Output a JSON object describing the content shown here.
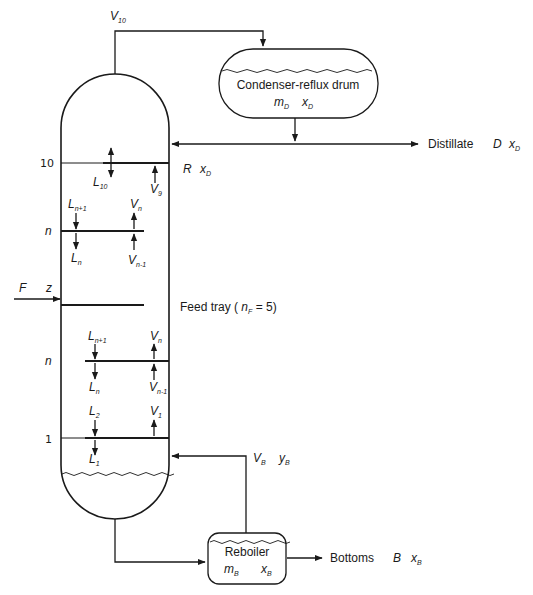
{
  "diagram": {
    "colors": {
      "line": "#1a1a1a",
      "background": "#ffffff"
    },
    "top_vapor": {
      "symbol": "V",
      "subscript": "10"
    },
    "condenser": {
      "label": "Condenser-reflux drum",
      "holdup": {
        "symbol": "m",
        "subscript": "D"
      },
      "composition": {
        "symbol": "x",
        "subscript": "D"
      }
    },
    "distillate": {
      "label": "Distillate",
      "flow": "D",
      "composition": {
        "symbol": "x",
        "subscript": "D"
      }
    },
    "reflux": {
      "flow": "R",
      "composition": {
        "symbol": "x",
        "subscript": "D"
      }
    },
    "trays": {
      "top": {
        "number": "10",
        "liquid": {
          "symbol": "L",
          "subscript": "10"
        },
        "vapor": {
          "symbol": "V",
          "subscript": "9"
        }
      },
      "rectifying_n": {
        "number": "n",
        "liquid_in": {
          "symbol": "L",
          "subscript": "n+1"
        },
        "liquid_out": {
          "symbol": "L",
          "subscript": "n"
        },
        "vapor_out": {
          "symbol": "V",
          "subscript": "n"
        },
        "vapor_in": {
          "symbol": "V",
          "subscript": "n-1"
        }
      },
      "feed": {
        "label_prefix": "Feed tray ( ",
        "symbol": "n",
        "subscript": "F",
        "label_suffix": " = 5)"
      },
      "stripping_n": {
        "number": "n",
        "liquid_in": {
          "symbol": "L",
          "subscript": "n+1"
        },
        "liquid_out": {
          "symbol": "L",
          "subscript": "n"
        },
        "vapor_out": {
          "symbol": "V",
          "subscript": "n"
        },
        "vapor_in": {
          "symbol": "V",
          "subscript": "n-1"
        }
      },
      "bottom": {
        "number": "1",
        "liquid_in": {
          "symbol": "L",
          "subscript": "2"
        },
        "liquid_out": {
          "symbol": "L",
          "subscript": "1"
        },
        "vapor_out": {
          "symbol": "V",
          "subscript": "1"
        }
      }
    },
    "feed": {
      "flow": "F",
      "composition": "z"
    },
    "boilup": {
      "flow": {
        "symbol": "V",
        "subscript": "B"
      },
      "composition": {
        "symbol": "y",
        "subscript": "B"
      }
    },
    "reboiler": {
      "label": "Reboiler",
      "holdup": {
        "symbol": "m",
        "subscript": "B"
      },
      "composition": {
        "symbol": "x",
        "subscript": "B"
      }
    },
    "bottoms": {
      "label": "Bottoms",
      "flow": "B",
      "composition": {
        "symbol": "x",
        "subscript": "B"
      }
    }
  }
}
